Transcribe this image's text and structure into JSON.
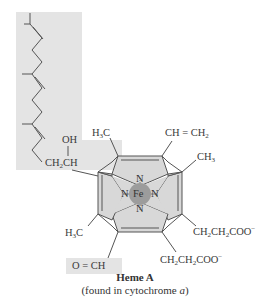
{
  "figure": {
    "title": "Heme A",
    "subtitle_prefix": "(found in cytochrome ",
    "subtitle_italic": "a",
    "subtitle_suffix": ")"
  },
  "labels": {
    "metal": "Fe",
    "nitrogen": "N",
    "oh": "OH",
    "ch2ch_a": "CH",
    "ch2ch_sub": "2",
    "ch2ch_b": "CH",
    "h3c_top_a": "H",
    "h3c_top_sub": "3",
    "h3c_top_b": "C",
    "vinyl_a": "CH",
    "vinyl_eq": " = ",
    "vinyl_b": "CH",
    "vinyl_sub": "2",
    "ch3_a": "CH",
    "ch3_sub": "3",
    "h3c_left_a": "H",
    "h3c_left_sub": "3",
    "h3c_left_b": "C",
    "prop1_a": "CH",
    "prop1_s1": "2",
    "prop1_b": "CH",
    "prop1_s2": "2",
    "prop1_c": "COO",
    "prop1_charge": "−",
    "prop2_a": "CH",
    "prop2_s1": "2",
    "prop2_b": "CH",
    "prop2_s2": "2",
    "prop2_c": "COO",
    "prop2_charge": "−",
    "formyl": "O = CH"
  },
  "colors": {
    "highlight_box": "#e3e3e3",
    "ring_fill": "#d9d9d9",
    "fe_circle": "#9e9e9e",
    "bond": "#555555"
  }
}
